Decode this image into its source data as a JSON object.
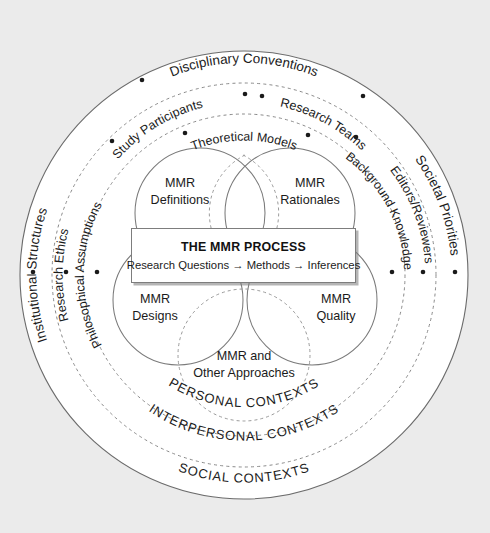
{
  "figure": {
    "title": "THE MMR PROCESS",
    "background_color": "#ebebeb",
    "circle_fill": "#ffffff",
    "line_color": "#6b6b6b"
  },
  "center_box": {
    "title": "THE MMR PROCESS",
    "subtitle": "Research Questions → Methods → Inferences"
  },
  "venn": {
    "circles": [
      {
        "id": "definitions",
        "line1": "MMR",
        "line2": "Definitions"
      },
      {
        "id": "rationales",
        "line1": "MMR",
        "line2": "Rationales"
      },
      {
        "id": "designs",
        "line1": "MMR",
        "line2": "Designs"
      },
      {
        "id": "quality",
        "line1": "MMR",
        "line2": "Quality"
      },
      {
        "id": "other-approaches",
        "line1": "MMR and",
        "line2": "Other Approaches"
      }
    ]
  },
  "rings": [
    {
      "id": "personal",
      "name": "PERSONAL CONTEXTS",
      "bottom_label": "PERSONAL CONTEXTS",
      "style": "dashed",
      "top_labels": [
        "Theoretical Models"
      ],
      "left_label": "Philosophical Assumptions",
      "right_label": "Background Knowledge"
    },
    {
      "id": "interpersonal",
      "name": "INTERPERSONAL CONTEXTS",
      "bottom_label": "INTERPERSONAL CONTEXTS",
      "style": "dashed",
      "top_labels": [
        "Study Participants",
        "Research Teams"
      ],
      "left_label": "Research Ethics",
      "right_label": "Editors/Reviewers"
    },
    {
      "id": "social",
      "name": "SOCIAL CONTEXTS",
      "bottom_label": "SOCIAL CONTEXTS",
      "style": "solid",
      "top_labels": [
        "Disciplinary Conventions"
      ],
      "left_label": "Institutional Structures",
      "right_label": "Societal Priorities"
    }
  ],
  "labels": {
    "disciplinary_conventions": "Disciplinary Conventions",
    "study_participants": "Study Participants",
    "research_teams": "Research Teams",
    "theoretical_models": "Theoretical Models",
    "institutional_structures": "Institutional Structures",
    "research_ethics": "Research Ethics",
    "philosophical_assumptions": "Philosophical Assumptions",
    "societal_priorities": "Societal Priorities",
    "editors_reviewers": "Editors/Reviewers",
    "background_knowledge": "Background Knowledge",
    "personal_contexts": "PERSONAL CONTEXTS",
    "interpersonal_contexts": "INTERPERSONAL CONTEXTS",
    "social_contexts": "SOCIAL CONTEXTS"
  }
}
